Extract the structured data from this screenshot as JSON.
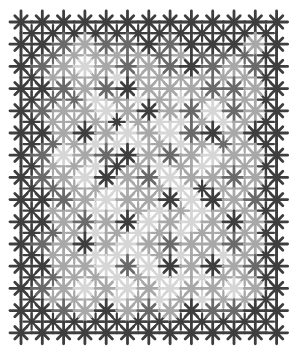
{
  "image": {
    "description": "Grayscale tiled pattern of eight-pointed stars on a lattice grid",
    "width": 299,
    "height": 356,
    "background": "#ffffff"
  },
  "pattern": {
    "major": {
      "cols": 13,
      "rows": 15,
      "origin_x": 21,
      "origin_y": 22,
      "step_x": 21.3,
      "step_y": 22.2,
      "radius": 11
    },
    "minor": {
      "radius": 8
    },
    "lattice_color": "#5a5a5a",
    "shades": [
      "#3e3e3e",
      "#6a6a6a",
      "#a8a8a8",
      "#d6d6d6"
    ],
    "major_shades": [
      "0000000000000",
      "0012110100020",
      "0123212101210",
      "0012102221120",
      "0122320213120",
      "0020232310200",
      "0132102123220",
      "0123021322120",
      "0012322030210",
      "0021203232020",
      "0120232122120",
      "0022313020210",
      "0123232322320",
      "0012021201100",
      "0000000000000"
    ],
    "minor_shades": [
      "000000000000",
      "012222121110",
      "022232222220",
      "011323232220",
      "022202332320",
      "012333232120",
      "022302323220",
      "012232230220",
      "022332323220",
      "012323232220",
      "022333232320",
      "012232333220",
      "022232323220",
      "000000000000"
    ]
  }
}
